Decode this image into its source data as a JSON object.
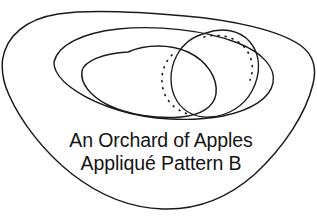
{
  "figure": {
    "name": "appliqué-pattern-line-drawing",
    "background_color": "#ffffff",
    "stroke_color": "#1a1a1a"
  },
  "caption": {
    "line1": "An Orchard of Apples",
    "line2": "Appliqué Pattern B"
  },
  "shapes": {
    "outer_blob_label": "outer rounded-triangle placement outline",
    "big_ellipse_label": "large background ellipse",
    "right_apple_label": "right apple shape",
    "front_apple_label": "front apple shape",
    "stitch_line_label": "dotted hidden-edge stitching guide"
  }
}
